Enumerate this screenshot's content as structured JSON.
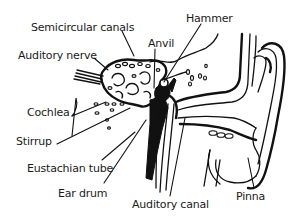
{
  "diagram": {
    "labels": {
      "semicircular_canals": "Semicircular canals",
      "auditory_nerve": "Auditory nerve",
      "anvil": "Anvil",
      "hammer": "Hammer",
      "cochlea": "Cochlea",
      "stirrup": "Stirrup",
      "eustachian_tube": "Eustachian tube",
      "ear_drum": "Ear drum",
      "auditory_canal": "Auditory canal",
      "pinna": "Pinna"
    },
    "colors": {
      "background": "#ffffff",
      "ink": "#111111"
    }
  }
}
